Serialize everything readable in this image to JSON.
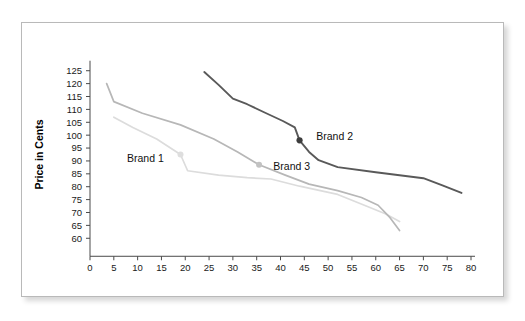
{
  "figure": {
    "background_color": "#ffffff",
    "plate_border_color": "#b9b9b9"
  },
  "chart_data": {
    "type": "line",
    "title": "",
    "subtitle": "",
    "xlabel": "",
    "ylabel": "Price in Cents",
    "xlim": [
      0,
      80
    ],
    "ylim": [
      57,
      128
    ],
    "xticks": [
      0,
      5,
      10,
      15,
      20,
      25,
      30,
      35,
      40,
      45,
      50,
      55,
      60,
      65,
      70,
      75,
      80
    ],
    "xtick_labels": [
      "0",
      "5",
      "10",
      "15",
      "20",
      "25",
      "30",
      "35",
      "40",
      "45",
      "50",
      "55",
      "60",
      "65",
      "70",
      "75",
      "80"
    ],
    "yticks": [
      60,
      65,
      70,
      75,
      80,
      85,
      90,
      95,
      100,
      105,
      110,
      115,
      120,
      125
    ],
    "ytick_labels": [
      "60",
      "65",
      "70",
      "75",
      "80",
      "85",
      "90",
      "95",
      "100",
      "105",
      "110",
      "115",
      "120",
      "125"
    ],
    "grid": false,
    "legend_position": "inline-annotations",
    "series": [
      {
        "name": "Brand 2",
        "color": "#595959",
        "stroke_width": 1.9,
        "label": "Brand 2",
        "label_x": 47.5,
        "label_y": 99.5,
        "marker": {
          "x": 44,
          "y": 98,
          "color": "#3d3d3d",
          "radius": 3.1
        },
        "points": [
          [
            24,
            124.5
          ],
          [
            27,
            119.5
          ],
          [
            30,
            114.2
          ],
          [
            33,
            112.0
          ],
          [
            37,
            108.5
          ],
          [
            40.5,
            105.5
          ],
          [
            43,
            103.0
          ],
          [
            44,
            98.0
          ],
          [
            46,
            93.5
          ],
          [
            48,
            90.3
          ],
          [
            52,
            87.6
          ],
          [
            60,
            85.6
          ],
          [
            70,
            83.3
          ],
          [
            74,
            80.5
          ],
          [
            78,
            77.6
          ]
        ]
      },
      {
        "name": "Brand 3",
        "color": "#b7b7b7",
        "stroke_width": 1.7,
        "label": "Brand 3",
        "label_x": 38.5,
        "label_y": 88.0,
        "marker": {
          "x": 35.5,
          "y": 88.5,
          "color": "#c2c2c2",
          "radius": 3.0
        },
        "points": [
          [
            3.5,
            120.0
          ],
          [
            5.0,
            113.0
          ],
          [
            11,
            108.5
          ],
          [
            19,
            104.0
          ],
          [
            26,
            98.5
          ],
          [
            31,
            93.5
          ],
          [
            35.5,
            88.5
          ],
          [
            41,
            84.5
          ],
          [
            46,
            81.0
          ],
          [
            52,
            78.5
          ],
          [
            57,
            75.8
          ],
          [
            60.5,
            72.8
          ],
          [
            63,
            68.0
          ],
          [
            65,
            63.0
          ]
        ]
      },
      {
        "name": "Brand 1",
        "color": "#dcdcdc",
        "stroke_width": 1.7,
        "label": "Brand 1",
        "label_x": 15.5,
        "label_y": 91.0,
        "marker": {
          "x": 19,
          "y": 92.5,
          "color": "#dedede",
          "radius": 3.0
        },
        "points": [
          [
            5.0,
            107.0
          ],
          [
            9,
            103.0
          ],
          [
            14,
            98.5
          ],
          [
            19,
            92.5
          ],
          [
            20.5,
            86.2
          ],
          [
            27,
            84.5
          ],
          [
            33,
            83.5
          ],
          [
            38,
            83.0
          ],
          [
            44,
            80.2
          ],
          [
            52,
            77.0
          ],
          [
            58,
            72.5
          ],
          [
            62,
            69.5
          ],
          [
            65,
            66.5
          ]
        ]
      }
    ]
  }
}
